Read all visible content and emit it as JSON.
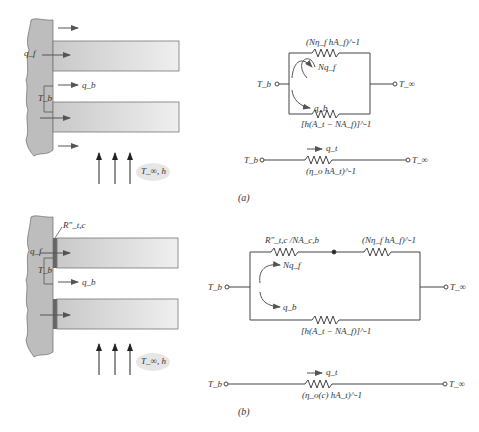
{
  "figure": {
    "panel_a": {
      "caption": "(a)",
      "schematic": {
        "labels": {
          "fin_heat": "q_f",
          "base_heat": "q_b",
          "base_temp": "T_b",
          "fluid": "T_∞, h"
        }
      },
      "circuit_parallel": {
        "left_node": "T_b",
        "right_node": "T_∞",
        "top_resistor": "(Nη_f hA_f)^-1",
        "bottom_resistor": "[h(A_t − NA_f)]^-1",
        "flow_top": "Nq_f",
        "flow_bottom": "q_b"
      },
      "circuit_equivalent": {
        "left_node": "T_b",
        "right_node": "T_∞",
        "resistor": "(η_o hA_t)^-1",
        "flow": "q_t"
      }
    },
    "panel_b": {
      "caption": "(b)",
      "schematic": {
        "labels": {
          "contact_resistance": "R″_t,c",
          "fin_heat": "q_f",
          "base_heat": "q_b",
          "base_temp": "T_b",
          "fluid": "T_∞, h"
        }
      },
      "circuit_parallel": {
        "left_node": "T_b",
        "right_node": "T_∞",
        "top_resistor_1": "R″_t,c /NA_c,b",
        "top_resistor_2": "(Nη_f hA_f)^-1",
        "bottom_resistor": "[h(A_t − NA_f)]^-1",
        "flow_top": "Nq_f",
        "flow_bottom": "q_b"
      },
      "circuit_equivalent": {
        "left_node": "T_b",
        "right_node": "T_∞",
        "resistor": "(η_o(c) hA_t)^-1",
        "flow": "q_t"
      }
    }
  }
}
